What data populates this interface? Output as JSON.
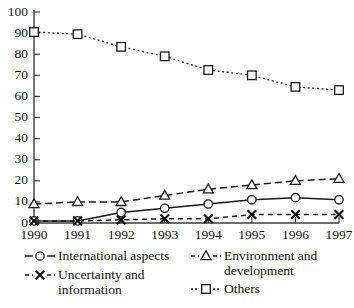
{
  "chart_data": {
    "type": "line",
    "title": "",
    "xlabel": "",
    "ylabel": "",
    "categories": [
      "1990",
      "1991",
      "1992",
      "1993",
      "1994",
      "1995",
      "1996",
      "1997"
    ],
    "x": [
      1990,
      1991,
      1992,
      1993,
      1994,
      1995,
      1996,
      1997
    ],
    "ylim": [
      0,
      100
    ],
    "yticks": [
      0,
      10,
      20,
      30,
      40,
      50,
      60,
      70,
      80,
      90,
      100
    ],
    "ytick_labels": [
      "0",
      "10",
      "20",
      "30",
      "40",
      "50",
      "60",
      "70",
      "80",
      "90",
      "100"
    ],
    "grid": false,
    "legend_position": "bottom",
    "series": [
      {
        "name": "International aspects",
        "marker": "circle",
        "linestyle": "solid",
        "values": [
          1,
          1,
          5,
          7,
          9,
          11,
          12,
          11
        ]
      },
      {
        "name": "Environment and development",
        "marker": "triangle",
        "linestyle": "dashed",
        "values": [
          9,
          10,
          10,
          13,
          16,
          18,
          20,
          21
        ]
      },
      {
        "name": "Uncertainty and information",
        "marker": "x",
        "linestyle": "dashed",
        "values": [
          1,
          1,
          1.5,
          2,
          2,
          4,
          4,
          4
        ]
      },
      {
        "name": "Others",
        "marker": "square",
        "linestyle": "dotted",
        "values": [
          90.5,
          89.5,
          83.5,
          79,
          72.5,
          70,
          64.5,
          63
        ]
      }
    ]
  },
  "legend": {
    "entries": [
      {
        "label": "International aspects",
        "marker": "circle",
        "linestyle": "solid"
      },
      {
        "label": "Environment and\ndevelopment",
        "marker": "triangle",
        "linestyle": "dashed"
      },
      {
        "label": "Uncertainty and\ninformation",
        "marker": "x",
        "linestyle": "dashed"
      },
      {
        "label": "Others",
        "marker": "square",
        "linestyle": "dotted"
      }
    ]
  },
  "colors": {
    "ink": "#1a1a1a",
    "axis": "#3b3b3b",
    "background": "#ffffff"
  }
}
